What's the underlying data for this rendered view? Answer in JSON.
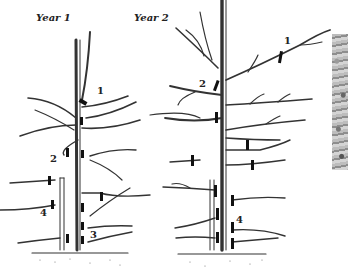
{
  "figure": {
    "panels": [
      {
        "title": "Year 1",
        "labels": [
          "1",
          "2",
          "4",
          "3"
        ]
      },
      {
        "title": "Year 2",
        "labels": [
          "1",
          "2",
          "4"
        ]
      }
    ]
  }
}
